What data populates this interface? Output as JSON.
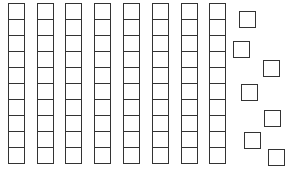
{
  "diagram": {
    "stroke_color": "#333333",
    "fill_color": "#ffffff",
    "tens_rods": {
      "count": 8,
      "cells_per_rod": 10,
      "cell_size": 17,
      "top": 3,
      "x_positions": [
        8,
        37,
        65,
        94,
        123,
        152,
        181,
        209
      ]
    },
    "units": {
      "count": 7,
      "size": 17,
      "positions": [
        {
          "x": 239,
          "y": 11
        },
        {
          "x": 233,
          "y": 41
        },
        {
          "x": 263,
          "y": 60
        },
        {
          "x": 241,
          "y": 84
        },
        {
          "x": 264,
          "y": 110
        },
        {
          "x": 244,
          "y": 132
        },
        {
          "x": 268,
          "y": 149
        }
      ]
    },
    "represented_value": 87
  }
}
